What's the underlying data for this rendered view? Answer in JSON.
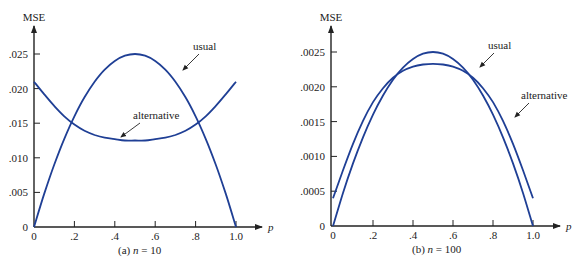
{
  "chart_data": [
    {
      "type": "line",
      "title": "",
      "caption": "(a) n = 10",
      "caption_prefix": "(a) ",
      "caption_var": "n",
      "caption_rest": " = 10",
      "xlabel": "p",
      "ylabel": "MSE",
      "xlim": [
        0,
        1.0
      ],
      "ylim": [
        0,
        0.028
      ],
      "xticks": [
        0,
        0.2,
        0.4,
        0.6,
        0.8,
        1.0
      ],
      "xtick_labels": [
        "0",
        ".2",
        ".4",
        ".6",
        ".8",
        "1.0"
      ],
      "yticks": [
        0,
        0.005,
        0.01,
        0.015,
        0.02,
        0.025
      ],
      "ytick_labels": [
        "0",
        ".005",
        ".010",
        ".015",
        ".020",
        ".025"
      ],
      "grid": false,
      "legend": "none (inline annotations)",
      "x": [
        0,
        0.05,
        0.1,
        0.15,
        0.2,
        0.25,
        0.3,
        0.35,
        0.4,
        0.45,
        0.5,
        0.55,
        0.6,
        0.65,
        0.7,
        0.75,
        0.8,
        0.85,
        0.9,
        0.95,
        1.0
      ],
      "series": [
        {
          "name": "usual",
          "values": [
            0,
            0.00475,
            0.009,
            0.01275,
            0.016,
            0.01875,
            0.021,
            0.02275,
            0.024,
            0.02475,
            0.025,
            0.02475,
            0.024,
            0.02275,
            0.021,
            0.01875,
            0.016,
            0.01275,
            0.009,
            0.00475,
            0
          ]
        },
        {
          "name": "alternative",
          "values": [
            0.021,
            0.0192,
            0.0175,
            0.016,
            0.0148,
            0.0139,
            0.0133,
            0.0129,
            0.0127,
            0.0125,
            0.0125,
            0.0125,
            0.0127,
            0.0129,
            0.0133,
            0.0139,
            0.0148,
            0.016,
            0.0175,
            0.0192,
            0.021
          ]
        }
      ],
      "annotations": [
        {
          "text": "usual",
          "target_series": "usual"
        },
        {
          "text": "alternative",
          "target_series": "alternative"
        }
      ]
    },
    {
      "type": "line",
      "title": "",
      "caption": "(b) n = 100",
      "caption_prefix": "(b) ",
      "caption_var": "n",
      "caption_rest": " = 100",
      "xlabel": "p",
      "ylabel": "MSE",
      "xlim": [
        0,
        1.0
      ],
      "ylim": [
        0,
        0.0028
      ],
      "xticks": [
        0,
        0.2,
        0.4,
        0.6,
        0.8,
        1.0
      ],
      "xtick_labels": [
        "0",
        ".2",
        ".4",
        ".6",
        ".8",
        "1.0"
      ],
      "yticks": [
        0,
        0.0005,
        0.001,
        0.0015,
        0.002,
        0.0025
      ],
      "ytick_labels": [
        "0",
        ".0005",
        ".0010",
        ".0015",
        ".0020",
        ".0025"
      ],
      "grid": false,
      "legend": "none (inline annotations)",
      "x": [
        0,
        0.05,
        0.1,
        0.15,
        0.2,
        0.25,
        0.3,
        0.35,
        0.4,
        0.45,
        0.5,
        0.55,
        0.6,
        0.65,
        0.7,
        0.75,
        0.8,
        0.85,
        0.9,
        0.95,
        1.0
      ],
      "series": [
        {
          "name": "usual",
          "values": [
            0,
            0.000475,
            0.0009,
            0.001275,
            0.0016,
            0.001875,
            0.0021,
            0.002275,
            0.0024,
            0.002475,
            0.0025,
            0.002475,
            0.0024,
            0.002275,
            0.0021,
            0.001875,
            0.0016,
            0.001275,
            0.0009,
            0.000475,
            0
          ]
        },
        {
          "name": "alternative",
          "values": [
            0.0004,
            0.0008,
            0.00118,
            0.00151,
            0.00178,
            0.00198,
            0.00213,
            0.00223,
            0.00229,
            0.00232,
            0.00233,
            0.00232,
            0.00229,
            0.00223,
            0.00213,
            0.00198,
            0.00178,
            0.00151,
            0.00118,
            0.0008,
            0.0004
          ]
        }
      ],
      "annotations": [
        {
          "text": "usual",
          "target_series": "usual"
        },
        {
          "text": "alternative",
          "target_series": "alternative"
        }
      ]
    }
  ],
  "colors": {
    "curve": "#1f3f95",
    "axis": "#222222",
    "background": "#ffffff"
  }
}
